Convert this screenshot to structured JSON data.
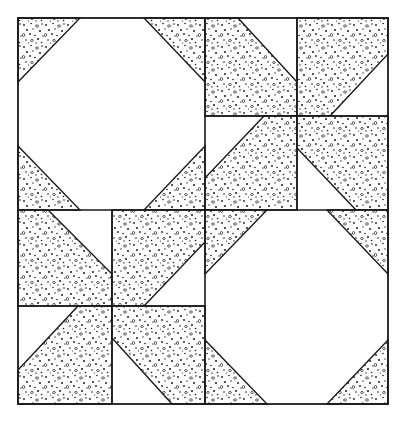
{
  "figure": {
    "colors": {
      "background": "#ffffff",
      "line": "#1a1a1a",
      "stipple_dot": "#1a1a1a"
    },
    "quadrants": [
      {
        "position": "top-left",
        "type": "octagon",
        "corner_triangles": 4
      },
      {
        "position": "top-right",
        "type": "pinwheel",
        "sub_squares": 4
      },
      {
        "position": "bottom-left",
        "type": "pinwheel",
        "sub_squares": 4
      },
      {
        "position": "bottom-right",
        "type": "octagon",
        "corner_triangles": 4
      }
    ]
  }
}
